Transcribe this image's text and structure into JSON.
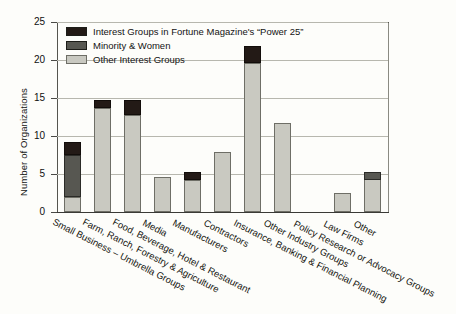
{
  "chart_data": {
    "type": "bar",
    "stacked": true,
    "title": "",
    "subtitle": "",
    "xlabel": "",
    "ylabel": "Number of Organizations",
    "ylim": [
      0,
      25
    ],
    "yticks": [
      0,
      5,
      10,
      15,
      20,
      25
    ],
    "ytick_labels": [
      "0",
      "5",
      "10",
      "15",
      "20",
      "25"
    ],
    "grid": true,
    "legend_position": "top-left",
    "categories": [
      "Small Business – Umbrella Groups",
      "Farm, Ranch, Forestry & Agriculture",
      "Food, Beverage, Hotel & Restaurant",
      "Media",
      "Manufacturers",
      "Contractors",
      "Insurance, Banking & Financial Planning",
      "Other Industry Groups",
      "Policy Research or Advocacy Groups",
      "Law Firms",
      "Other"
    ],
    "series": [
      {
        "name": "Other Interest Groups",
        "color": "#c9c9c1",
        "values": [
          2.0,
          13.7,
          12.8,
          4.6,
          4.2,
          7.9,
          19.6,
          11.7,
          0.0,
          2.5,
          4.3
        ]
      },
      {
        "name": "Minority & Women",
        "color": "#575751",
        "values": [
          5.5,
          0.0,
          0.0,
          0.0,
          0.0,
          0.0,
          0.0,
          0.0,
          0.0,
          0.0,
          1.0
        ]
      },
      {
        "name": "Interest Groups in Fortune Magazine's “Power 25”",
        "color": "#231a16",
        "values": [
          1.7,
          1.0,
          2.0,
          0.0,
          1.0,
          0.0,
          2.2,
          0.0,
          0.0,
          0.0,
          0.0
        ]
      }
    ],
    "totals": [
      9.2,
      14.7,
      14.8,
      4.6,
      5.2,
      7.9,
      21.8,
      11.7,
      0.0,
      2.5,
      5.3
    ]
  },
  "legend": {
    "items": [
      {
        "label": "Interest Groups in Fortune Magazine's “Power 25”",
        "color": "#231a16"
      },
      {
        "label": "Minority & Women",
        "color": "#575751"
      },
      {
        "label": "Other Interest Groups",
        "color": "#c9c9c1"
      }
    ]
  },
  "axes": {
    "y_title": "Number of Organizations",
    "y_tick_labels": [
      "25",
      "20",
      "15",
      "10",
      "5",
      "0"
    ]
  },
  "x_axis_labels": [
    "Small Business – Umbrella Groups",
    "Farm, Ranch, Forestry & Agriculture",
    "Food, Beverage, Hotel & Restaurant",
    "Media",
    "Manufacturers",
    "Contractors",
    "Insurance, Banking & Financial Planning",
    "Other Industry Groups",
    "Policy Research or Advocacy Groups",
    "Law Firms",
    "Other"
  ],
  "colors": {
    "power25": "#231a16",
    "minority": "#575751",
    "other": "#c9c9c1",
    "grid": "#b7b7ae",
    "frame": "#55554f",
    "text": "#141414",
    "background": "#fdfdfa"
  }
}
